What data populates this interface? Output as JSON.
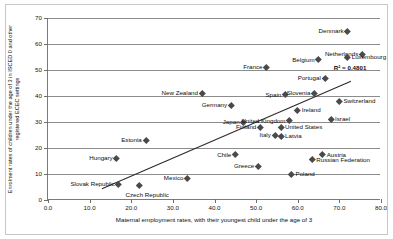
{
  "chart_data": {
    "type": "scatter",
    "title": "",
    "xlabel": "Maternal employment rates, with their youngest child under the age of 3",
    "ylabel": "Enrolment rates of children under the age of 3 in ISCED 0 and other registered ECEC settings",
    "xlim": [
      0,
      80
    ],
    "ylim": [
      0,
      70
    ],
    "xticks": [
      "0.0",
      "10.0",
      "20.0",
      "30.0",
      "40.0",
      "50.0",
      "60.0",
      "70.0",
      "80.0"
    ],
    "yticks": [
      "0",
      "10",
      "20",
      "30",
      "40",
      "50",
      "60",
      "70"
    ],
    "grid": "horizontal",
    "legend": "none",
    "annotation": "R² = 0.4801",
    "trendline": {
      "x1": 13.0,
      "y1": 4.0,
      "x2": 73.0,
      "y2": 45.5
    },
    "marker_color": "#4a4a4a",
    "gridline_color": "#8c8c8c",
    "points": [
      {
        "label": "Denmark",
        "x": 72.0,
        "y": 65.0,
        "side": "left"
      },
      {
        "label": "Netherlands",
        "x": 75.5,
        "y": 56.0,
        "side": "left"
      },
      {
        "label": "Luxembourg",
        "x": 72.0,
        "y": 55.0,
        "side": "right"
      },
      {
        "label": "Belgium",
        "x": 65.0,
        "y": 54.0,
        "side": "left"
      },
      {
        "label": "France",
        "x": 52.5,
        "y": 51.0,
        "side": "left"
      },
      {
        "label": "Portugal",
        "x": 66.5,
        "y": 47.0,
        "side": "left"
      },
      {
        "label": "New Zealand",
        "x": 37.0,
        "y": 41.0,
        "side": "left"
      },
      {
        "label": "Spain",
        "x": 57.0,
        "y": 40.5,
        "side": "left"
      },
      {
        "label": "Slovenia",
        "x": 64.0,
        "y": 41.0,
        "side": "left"
      },
      {
        "label": "Switzerland",
        "x": 70.0,
        "y": 38.0,
        "side": "right"
      },
      {
        "label": "Germany",
        "x": 44.0,
        "y": 36.5,
        "side": "left"
      },
      {
        "label": "Ireland",
        "x": 60.0,
        "y": 34.5,
        "side": "right"
      },
      {
        "label": "Israel",
        "x": 68.0,
        "y": 31.0,
        "side": "right"
      },
      {
        "label": "Japan",
        "x": 47.0,
        "y": 30.0,
        "side": "left"
      },
      {
        "label": "United Kingdom",
        "x": 58.0,
        "y": 30.5,
        "side": "left"
      },
      {
        "label": "Finland",
        "x": 51.0,
        "y": 28.0,
        "side": "left"
      },
      {
        "label": "United States",
        "x": 56.0,
        "y": 28.0,
        "side": "right"
      },
      {
        "label": "Italy",
        "x": 54.5,
        "y": 25.0,
        "side": "left"
      },
      {
        "label": "Latvia",
        "x": 56.0,
        "y": 24.5,
        "side": "right"
      },
      {
        "label": "Estonia",
        "x": 23.5,
        "y": 23.0,
        "side": "left"
      },
      {
        "label": "Chile",
        "x": 45.0,
        "y": 17.5,
        "side": "left"
      },
      {
        "label": "Austria",
        "x": 66.0,
        "y": 17.5,
        "side": "right"
      },
      {
        "label": "Hungary",
        "x": 16.5,
        "y": 16.0,
        "side": "left"
      },
      {
        "label": "Russian Federation",
        "x": 63.5,
        "y": 15.5,
        "side": "right"
      },
      {
        "label": "Greece",
        "x": 50.5,
        "y": 13.0,
        "side": "left"
      },
      {
        "label": "Mexico",
        "x": 33.5,
        "y": 8.5,
        "side": "left"
      },
      {
        "label": "Poland",
        "x": 58.5,
        "y": 10.0,
        "side": "right"
      },
      {
        "label": "Slovak Republic",
        "x": 17.0,
        "y": 6.0,
        "side": "left"
      },
      {
        "label": "Czech Republic",
        "x": 22.0,
        "y": 5.5,
        "side": "below"
      }
    ]
  }
}
